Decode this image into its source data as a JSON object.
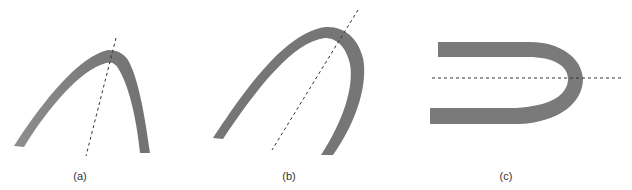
{
  "figure": {
    "panels": [
      {
        "id": "a",
        "label": "(a)"
      },
      {
        "id": "b",
        "label": "(b)"
      },
      {
        "id": "c",
        "label": "(c)"
      }
    ],
    "colors": {
      "band": "#787878",
      "band_light": "#8a8a8a",
      "dash": "#333333",
      "background": "#ffffff"
    }
  }
}
